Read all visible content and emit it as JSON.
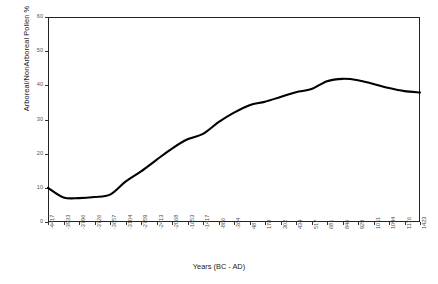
{
  "chart_data": {
    "type": "line",
    "title": "",
    "xlabel": "Years (BC - AD)",
    "ylabel": "Arboreal/NonArboreal Pollen %",
    "grid": false,
    "legend": false,
    "ylim": [
      0,
      60
    ],
    "y_ticks": [
      0,
      10,
      20,
      30,
      40,
      50,
      60
    ],
    "y_tick_labels": [
      "0",
      "10",
      "20",
      "30",
      "40",
      "50",
      "60"
    ],
    "categories": [
      "-4417",
      "-3933",
      "-3796",
      "-3726",
      "-3657",
      "-3104",
      "-2759",
      "-2413",
      "-2068",
      "-1653",
      "-1417",
      "-886",
      "-364",
      "48",
      "178",
      "302",
      "434",
      "517",
      "681",
      "846",
      "929",
      "1011",
      "1094",
      "1176",
      "1423"
    ],
    "values": [
      10.0,
      7.2,
      7.0,
      7.3,
      8.0,
      11.8,
      14.8,
      18.2,
      21.5,
      24.2,
      25.8,
      29.2,
      32.0,
      34.2,
      35.2,
      36.6,
      38.0,
      38.9,
      41.2,
      41.9,
      41.5,
      40.4,
      39.2,
      38.3,
      37.9
    ],
    "series_name": "Arboreal/NonArboreal Pollen %",
    "line_color": "#000000",
    "line_width": 2.1
  }
}
